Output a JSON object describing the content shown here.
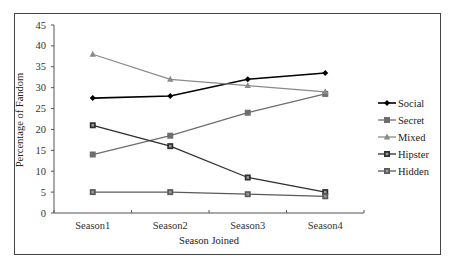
{
  "chart_data": {
    "type": "line",
    "title": "",
    "xlabel": "Season Joined",
    "ylabel": "Percentage of Fandom",
    "categories": [
      "Season1",
      "Season2",
      "Season3",
      "Season4"
    ],
    "ylim": [
      0,
      45
    ],
    "yticks": [
      0,
      5,
      10,
      15,
      20,
      25,
      30,
      35,
      40,
      45
    ],
    "grid": false,
    "legend_position": "right",
    "series": [
      {
        "name": "Social",
        "values": [
          27.5,
          28,
          32,
          33.5
        ],
        "color": "#000000",
        "marker": "diamond"
      },
      {
        "name": "Secret",
        "values": [
          14,
          18.5,
          24,
          28.5
        ],
        "color": "#6e6e6e",
        "marker": "square"
      },
      {
        "name": "Mixed",
        "values": [
          38,
          32,
          30.5,
          29
        ],
        "color": "#8a8a8a",
        "marker": "triangle"
      },
      {
        "name": "Hipster",
        "values": [
          21,
          16,
          8.5,
          5
        ],
        "color": "#2e2e2e",
        "marker": "square-hollow"
      },
      {
        "name": "Hidden",
        "values": [
          5,
          5,
          4.5,
          4
        ],
        "color": "#5a5a5a",
        "marker": "square-hollow"
      }
    ]
  }
}
